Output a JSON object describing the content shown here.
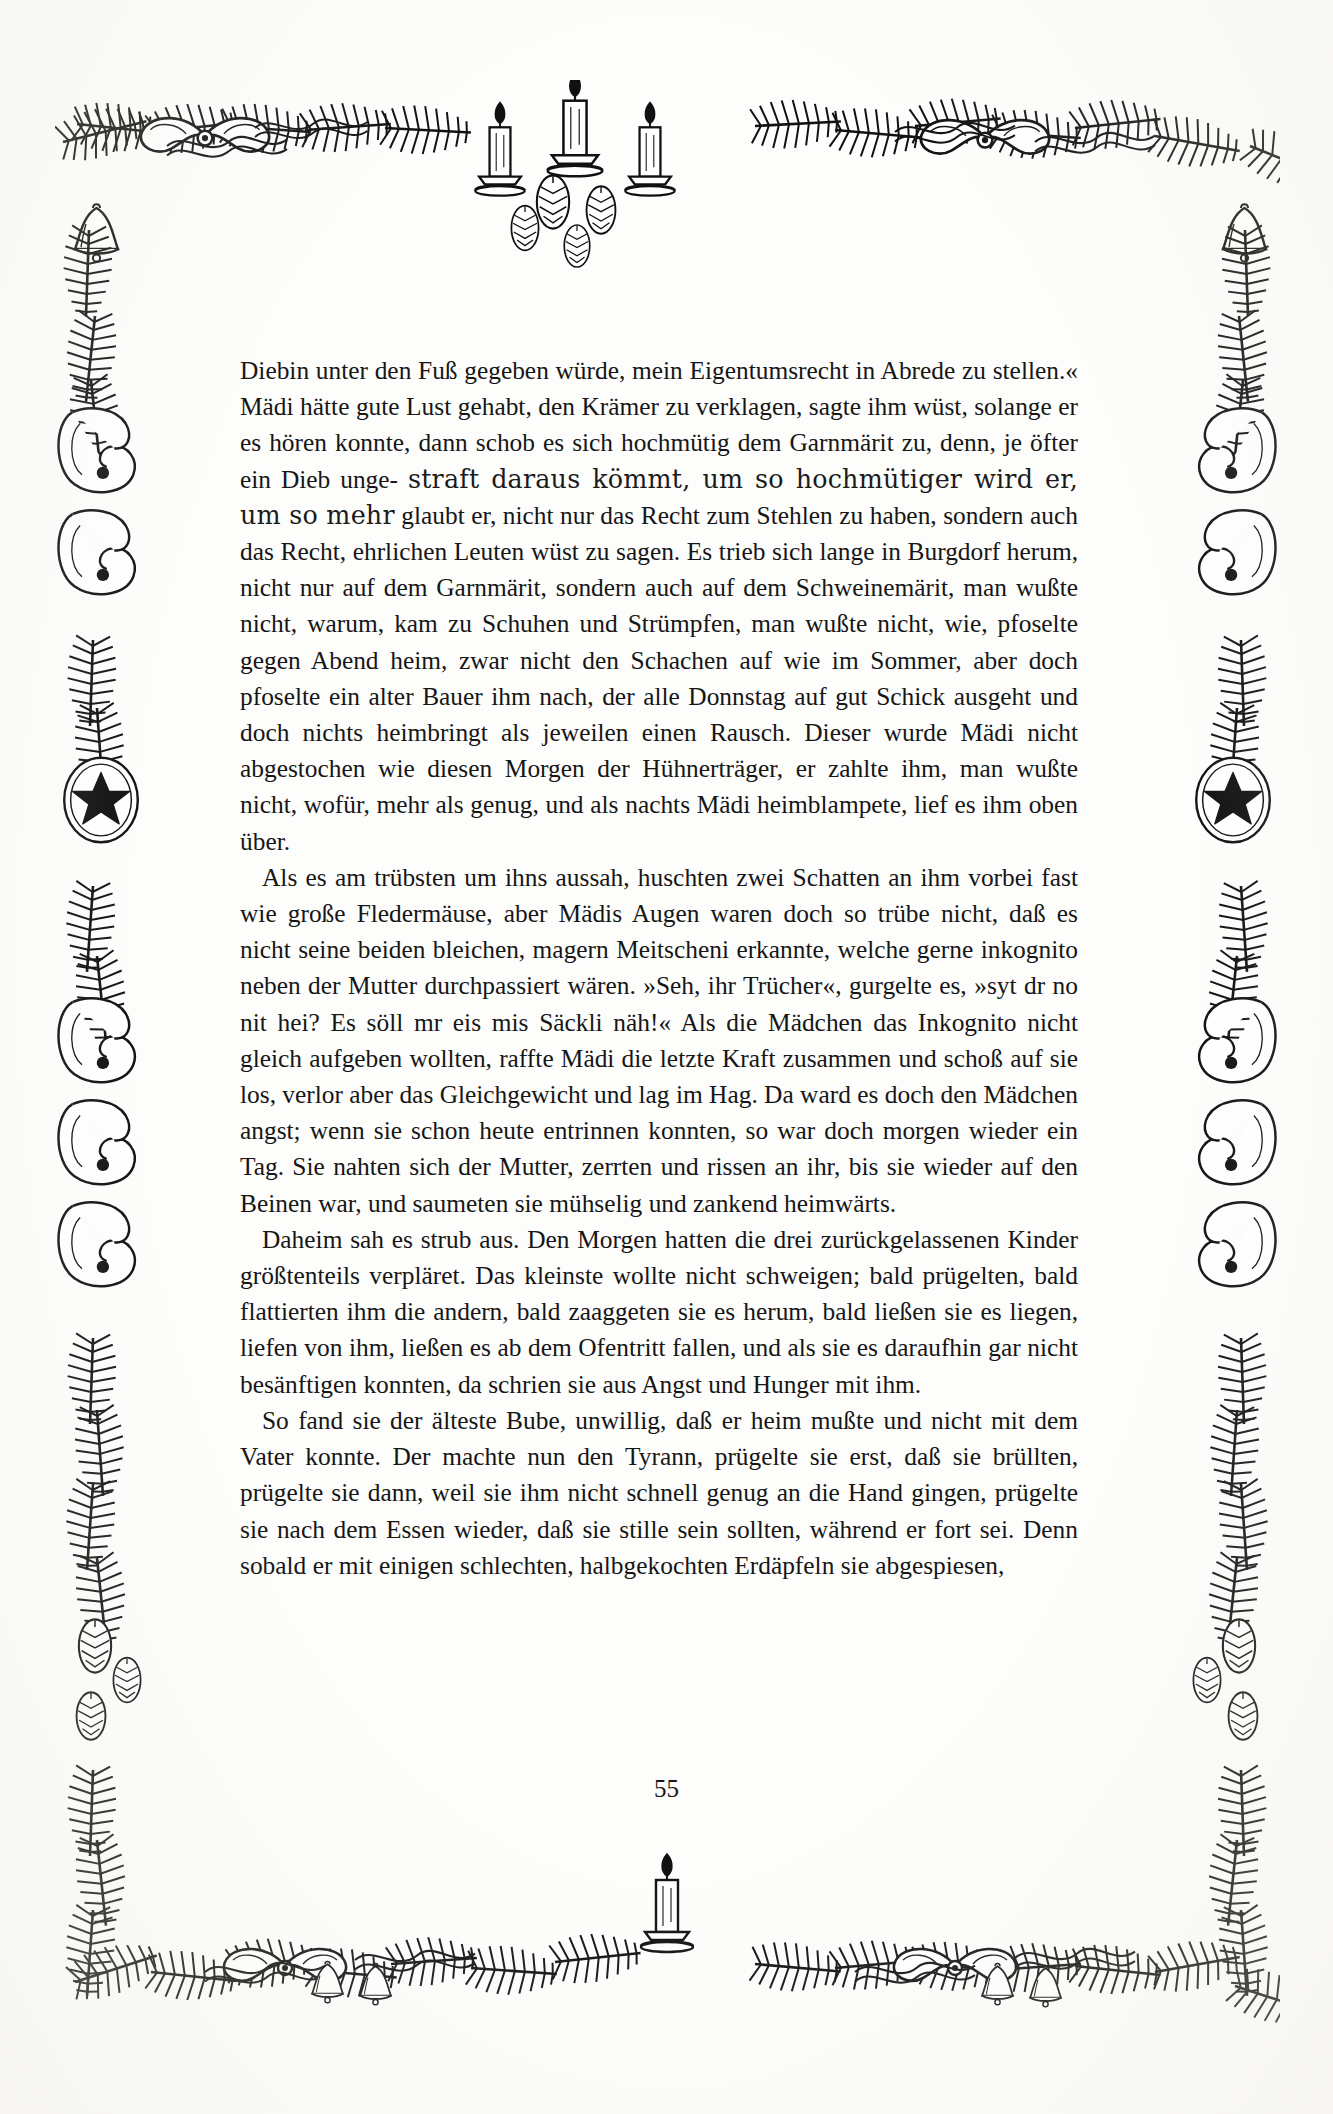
{
  "document": {
    "page_number": "55",
    "language": "de",
    "ink_color": "#161616",
    "paper_color": "#fdfdfc"
  },
  "body": {
    "paragraphs": [
      {
        "id": "paragraph-1",
        "continued_from_previous": true,
        "segments": [
          {
            "style": "normal",
            "text": "Diebin unter den Fuß gegeben würde, mein Eigentumsrecht in Abrede zu stellen.« Mädi hätte gute Lust gehabt, den Krämer zu verklagen, sagte ihm wüst, solange er es hören konnte, dann schob es sich hochmütig dem Garnmärit zu, denn, je öfter ein Dieb unge-"
          },
          {
            "style": "degraded",
            "text": "straft daraus kömmt, um so hochmütiger wird er, um so mehr"
          },
          {
            "style": "normal",
            "text": "glaubt er, nicht nur das Recht zum Stehlen zu haben, sondern auch das Recht, ehrlichen Leuten wüst zu sagen. Es trieb sich lange in Burgdorf herum, nicht nur auf dem Garnmärit, sondern auch auf dem Schweinemärit, man wußte nicht, warum, kam zu Schuhen und Strümpfen, man wußte nicht, wie, pfoselte gegen Abend heim, zwar nicht den Schachen auf wie im Sommer, aber doch pfoselte ein alter Bauer ihm nach, der alle Donnstag auf gut Schick ausgeht und doch nichts heimbringt als jeweilen einen Rausch. Dieser wurde Mädi nicht abgestochen wie diesen Morgen der Hühnerträger, er zahlte ihm, man wußte nicht, wofür, mehr als genug, und als nachts Mädi heimblampete, lief es ihm oben über."
          }
        ]
      },
      {
        "id": "paragraph-2",
        "text": "Als es am trübsten um ihns aussah, huschten zwei Schatten an ihm vorbei fast wie große Fledermäuse, aber Mädis Augen waren doch so trübe nicht, daß es nicht seine beiden bleichen, magern Meitscheni erkannte, welche gerne inkognito neben der Mutter durchpassiert wären. »Seh, ihr Trücher«, gurgelte es, »syt dr no nit hei? Es söll mr eis mis Säckli näh!« Als die Mädchen das Inkognito nicht gleich aufgeben wollten, raffte Mädi die letzte Kraft zusammen und schoß auf sie los, verlor aber das Gleichgewicht und lag im Hag. Da ward es doch den Mädchen angst; wenn sie schon heute entrinnen konnten, so war doch morgen wieder ein Tag. Sie nahten sich der Mutter, zerrten und rissen an ihr, bis sie wieder auf den Beinen war, und saumeten sie mühselig und zankend heimwärts."
      },
      {
        "id": "paragraph-3",
        "text": "Daheim sah es strub aus. Den Morgen hatten die drei zurückgelassenen Kinder größtenteils verpläret. Das kleinste wollte nicht schweigen; bald prügelten, bald flattierten ihm die andern, bald zaaggeten sie es herum, bald ließen sie es liegen, liefen von ihm, ließen es ab dem Ofentritt fallen, und als sie es daraufhin gar nicht besänftigen konnten, da schrien sie aus Angst und Hunger mit ihm."
      },
      {
        "id": "paragraph-4",
        "text": "So fand sie der älteste Bube, unwillig, daß er heim mußte und nicht mit dem Vater konnte. Der machte nun den Tyrann, prügelte sie erst, daß sie brüllten, prügelte sie dann, weil sie ihm nicht schnell genug an die Hand gingen, prügelte sie nach dem Essen wieder, daß sie stille sein sollten, während er fort sei. Denn sobald er mit einigen schlechten, halbgekochten Erdäpfeln sie abgespiesen,"
      }
    ]
  },
  "ornament": {
    "description": "christmas-border",
    "top_motifs": [
      "pine-branch",
      "ribbon-bow",
      "candle",
      "candle",
      "candle",
      "pinecone",
      "ribbon-bow",
      "pine-branch"
    ],
    "left_motifs": [
      "hanging-bell",
      "pine-branch",
      "ribbon-scroll",
      "ribbon-scroll",
      "pine-branch",
      "star-medallion",
      "pine-branch",
      "ribbon-scroll",
      "ribbon-scroll",
      "pinecone"
    ],
    "right_motifs": [
      "hanging-bell",
      "pine-branch",
      "ribbon-scroll",
      "ribbon-scroll",
      "pine-branch",
      "star-medallion",
      "pine-branch",
      "ribbon-scroll",
      "ribbon-scroll",
      "pinecone"
    ],
    "bottom_motifs": [
      "pine-branch",
      "ribbon-bow",
      "bell",
      "bell",
      "candle",
      "pine-branch",
      "ribbon-bow",
      "bell",
      "bell"
    ],
    "line_color": "#111111"
  }
}
